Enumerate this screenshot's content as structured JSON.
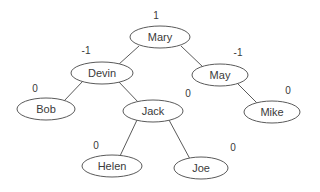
{
  "diagram": {
    "type": "avl-binary-search-tree",
    "background_color": "#ffffff",
    "stroke_color": "#5a5a5a",
    "text_color": "#3a3a3a",
    "nodes": [
      {
        "id": "mary",
        "label": "Mary",
        "balance": "1",
        "cx": 160,
        "cy": 37,
        "rx": 30,
        "ry": 11,
        "bx": 156,
        "by": 16
      },
      {
        "id": "devin",
        "label": "Devin",
        "balance": "-1",
        "cx": 102,
        "cy": 73,
        "rx": 31,
        "ry": 11,
        "bx": 86,
        "by": 51
      },
      {
        "id": "may",
        "label": "May",
        "balance": "-1",
        "cx": 220,
        "cy": 75,
        "rx": 28,
        "ry": 11,
        "bx": 238,
        "by": 53
      },
      {
        "id": "bob",
        "label": "Bob",
        "balance": "0",
        "cx": 46,
        "cy": 109,
        "rx": 29,
        "ry": 11,
        "bx": 35,
        "by": 89
      },
      {
        "id": "jack",
        "label": "Jack",
        "balance": "0",
        "cx": 153,
        "cy": 111,
        "rx": 30,
        "ry": 11,
        "bx": 188,
        "by": 94
      },
      {
        "id": "mike",
        "label": "Mike",
        "balance": "0",
        "cx": 272,
        "cy": 112,
        "rx": 28,
        "ry": 11,
        "bx": 288,
        "by": 91
      },
      {
        "id": "helen",
        "label": "Helen",
        "balance": "0",
        "cx": 112,
        "cy": 166,
        "rx": 30,
        "ry": 11,
        "bx": 96,
        "by": 146
      },
      {
        "id": "joe",
        "label": "Joe",
        "balance": "0",
        "cx": 201,
        "cy": 168,
        "rx": 27,
        "ry": 11,
        "bx": 233,
        "by": 148
      }
    ],
    "edges": [
      {
        "id": "mary-devin",
        "from": "mary",
        "to": "devin",
        "x1": 139,
        "y1": 46,
        "x2": 118,
        "y2": 65
      },
      {
        "id": "mary-may",
        "from": "mary",
        "to": "may",
        "x1": 181,
        "y1": 46,
        "x2": 203,
        "y2": 67
      },
      {
        "id": "devin-bob",
        "from": "devin",
        "to": "bob",
        "x1": 83,
        "y1": 81,
        "x2": 64,
        "y2": 101
      },
      {
        "id": "devin-jack",
        "from": "devin",
        "to": "jack",
        "x1": 118,
        "y1": 81,
        "x2": 139,
        "y2": 103
      },
      {
        "id": "may-mike",
        "from": "may",
        "to": "mike",
        "x1": 238,
        "y1": 84,
        "x2": 258,
        "y2": 104
      },
      {
        "id": "jack-helen",
        "from": "jack",
        "to": "helen",
        "x1": 137,
        "y1": 120,
        "x2": 120,
        "y2": 156
      },
      {
        "id": "jack-joe",
        "from": "jack",
        "to": "joe",
        "x1": 169,
        "y1": 120,
        "x2": 190,
        "y2": 159
      }
    ]
  }
}
